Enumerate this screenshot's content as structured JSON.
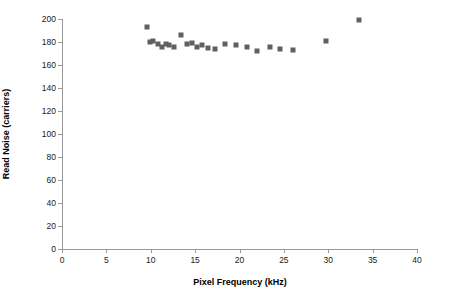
{
  "chart_data": {
    "type": "scatter",
    "title": "",
    "xlabel": "Pixel Frequency (kHz)",
    "ylabel": "Read Noise (carriers)",
    "xlim": [
      0,
      40
    ],
    "ylim": [
      0,
      200
    ],
    "xticks": [
      0,
      5,
      10,
      15,
      20,
      25,
      30,
      35,
      40
    ],
    "yticks": [
      0,
      20,
      40,
      60,
      80,
      100,
      120,
      140,
      160,
      180,
      200
    ],
    "xtick_labels": [
      "0",
      "5",
      "10",
      "15",
      "20",
      "25",
      "30",
      "35",
      "40"
    ],
    "ytick_labels": [
      "0",
      "20",
      "40",
      "60",
      "80",
      "100",
      "120",
      "140",
      "160",
      "180",
      "200"
    ],
    "grid": false,
    "legend": null,
    "marker": "square",
    "marker_color": "#606060",
    "marker_size_px": 5,
    "series": [
      {
        "name": "Read noise vs pixel frequency",
        "points": [
          {
            "x": 9.6,
            "y": 193
          },
          {
            "x": 9.9,
            "y": 180
          },
          {
            "x": 10.3,
            "y": 181
          },
          {
            "x": 10.8,
            "y": 178
          },
          {
            "x": 11.3,
            "y": 176
          },
          {
            "x": 11.7,
            "y": 178
          },
          {
            "x": 12.1,
            "y": 177
          },
          {
            "x": 12.6,
            "y": 176
          },
          {
            "x": 13.4,
            "y": 186
          },
          {
            "x": 14.1,
            "y": 178
          },
          {
            "x": 14.6,
            "y": 179
          },
          {
            "x": 15.2,
            "y": 176
          },
          {
            "x": 15.8,
            "y": 177
          },
          {
            "x": 16.4,
            "y": 175
          },
          {
            "x": 17.2,
            "y": 174
          },
          {
            "x": 18.4,
            "y": 178
          },
          {
            "x": 19.6,
            "y": 177
          },
          {
            "x": 20.8,
            "y": 176
          },
          {
            "x": 22.0,
            "y": 172
          },
          {
            "x": 23.4,
            "y": 176
          },
          {
            "x": 24.6,
            "y": 174
          },
          {
            "x": 26.0,
            "y": 173
          },
          {
            "x": 29.8,
            "y": 181
          },
          {
            "x": 33.5,
            "y": 199
          }
        ]
      }
    ]
  }
}
